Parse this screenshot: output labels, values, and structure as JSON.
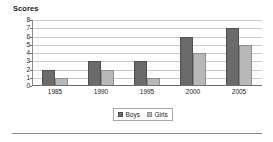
{
  "chart_data": {
    "type": "bar",
    "title": "Scores",
    "xlabel": "",
    "ylabel": "",
    "categories": [
      "1985",
      "1990",
      "1995",
      "2000",
      "2005"
    ],
    "series": [
      {
        "name": "Boys",
        "values": [
          2,
          3,
          3,
          6,
          7
        ],
        "color": "#6b6b6b"
      },
      {
        "name": "Girls",
        "values": [
          1,
          2,
          1,
          4,
          5
        ],
        "color": "#b8b8b8"
      }
    ],
    "ylim": [
      0,
      8
    ],
    "yticks": [
      8,
      7,
      6,
      5,
      4,
      3,
      2,
      1,
      0
    ],
    "grid": true,
    "legend_position": "bottom"
  },
  "legend": {
    "entries": [
      {
        "label": "Boys"
      },
      {
        "label": "Girls"
      }
    ]
  }
}
